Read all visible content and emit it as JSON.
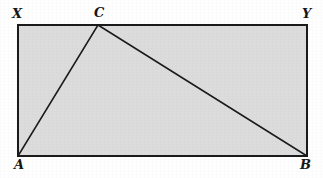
{
  "figure": {
    "kind": "geometry-diagram",
    "background_color": "#fefefe",
    "rectangle": {
      "name": "rectangle-XABY",
      "fill_color": "#dcdcdc",
      "stroke_color": "#1a1a1a",
      "stroke_width": 1.6,
      "corners": {
        "top_left": {
          "x": 18,
          "y": 25
        },
        "top_right": {
          "x": 307,
          "y": 25
        },
        "bottom_right": {
          "x": 307,
          "y": 156
        },
        "bottom_left": {
          "x": 18,
          "y": 156
        }
      }
    },
    "triangle": {
      "name": "triangle-ACB",
      "fill_color": "none",
      "stroke_color": "#1a1a1a",
      "stroke_width": 1.5,
      "points": {
        "A": {
          "x": 18,
          "y": 156
        },
        "C": {
          "x": 98,
          "y": 25
        },
        "B": {
          "x": 307,
          "y": 156
        }
      }
    },
    "segments": [
      {
        "name": "segment-AC",
        "from": "A",
        "to": "C"
      },
      {
        "name": "segment-CB",
        "from": "C",
        "to": "B"
      },
      {
        "name": "segment-AB",
        "from": "A",
        "to": "B"
      }
    ],
    "labels": {
      "x": "X",
      "c": "C",
      "y": "Y",
      "a": "A",
      "b": "B"
    }
  }
}
